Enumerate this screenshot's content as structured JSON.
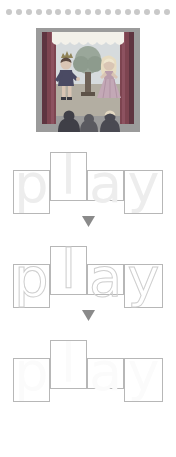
{
  "page": {
    "background": "#ffffff"
  },
  "decor": {
    "dot_row": {
      "name": "dot-border",
      "count": 17,
      "color": "#c9c9c9"
    }
  },
  "illustration": {
    "name": "theater-play-illustration",
    "alt": "Puppet theater stage with curtains, a king and a princess acting beside a tree, and three audience heads in front",
    "colors": {
      "curtain": "#7d4450",
      "curtain_dark": "#5e3440",
      "valance": "#f2f0ea",
      "sky": "#cfd8dc",
      "ground": "#b9b3a6",
      "tree_foliage": "#9aa79a",
      "tree_trunk": "#6e6257",
      "king_coat": "#4a4a63",
      "princess_dress": "#c3a8b6",
      "princess_hair": "#efe6cf",
      "audience": "#4d4d55",
      "frame": "#8e8e8e"
    }
  },
  "word": {
    "text": "play",
    "letters": [
      {
        "char": "p",
        "name": "letter-p",
        "zone": "descender"
      },
      {
        "char": "l",
        "name": "letter-l",
        "zone": "ascender"
      },
      {
        "char": "a",
        "name": "letter-a",
        "zone": "x-height"
      },
      {
        "char": "y",
        "name": "letter-y",
        "zone": "descender"
      }
    ]
  },
  "practice_rows": [
    {
      "name": "practice-row-model",
      "style": "solid",
      "letter_color": "#ededed",
      "box_color": "#b7b7b7",
      "letters": [
        "p",
        "l",
        "a",
        "y"
      ]
    },
    {
      "name": "practice-row-trace",
      "style": "dotted",
      "letter_color": "#cfcfcf",
      "box_color": "#b7b7b7",
      "letters": [
        "p",
        "l",
        "a",
        "y"
      ]
    },
    {
      "name": "practice-row-blank",
      "style": "blank",
      "letter_color": "#fbfbfb",
      "box_color": "#b7b7b7",
      "letters": [
        "p",
        "l",
        "a",
        "y"
      ]
    }
  ],
  "arrows": [
    {
      "name": "arrow-down-1",
      "direction": "down",
      "color": "#8a8a8a"
    },
    {
      "name": "arrow-down-2",
      "direction": "down",
      "color": "#8a8a8a"
    }
  ]
}
